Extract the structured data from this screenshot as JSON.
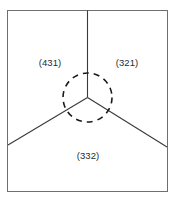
{
  "figure": {
    "type": "diagram",
    "background_color": "#ffffff",
    "frame": {
      "name": "outer-border",
      "x": 7,
      "y": 10,
      "width": 161,
      "height": 182,
      "stroke_color": "#6f6f6f",
      "stroke_width": 1
    },
    "junction": {
      "name": "triple-junction-point",
      "x": 87.5,
      "y": 97.5
    },
    "highlight_circle": {
      "name": "dashed-highlight-circle",
      "cx": 87.5,
      "cy": 97.5,
      "r": 24.5,
      "stroke_color": "#1a1a1a",
      "stroke_width": 1.6,
      "dash_pattern": "6 5"
    },
    "boundaries": [
      {
        "name": "boundary-vertical-up",
        "x1": 87.5,
        "y1": 97.5,
        "x2": 87.5,
        "y2": 10,
        "stroke_color": "#3a3a3a",
        "stroke_width": 1.1
      },
      {
        "name": "boundary-diagonal-left-down",
        "x1": 87.5,
        "y1": 97.5,
        "x2": 8,
        "y2": 145,
        "stroke_color": "#3a3a3a",
        "stroke_width": 1.1
      },
      {
        "name": "boundary-diagonal-right-down",
        "x1": 87.5,
        "y1": 97.5,
        "x2": 167,
        "y2": 147,
        "stroke_color": "#3a3a3a",
        "stroke_width": 1.1
      }
    ],
    "labels": {
      "left_grain": "(431)",
      "right_grain": "(321)",
      "bottom_grain": "(332)",
      "text_color": "#2b2b2b"
    }
  }
}
